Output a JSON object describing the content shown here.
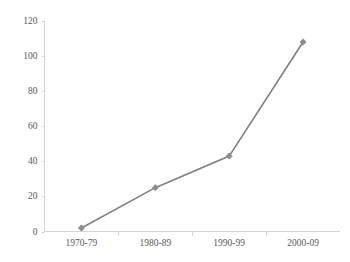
{
  "chart_data": {
    "type": "line",
    "title": "",
    "subtitle": "",
    "xlabel": "",
    "ylabel": "",
    "categories": [
      "1970-79",
      "1980-89",
      "1990-99",
      "2000-09"
    ],
    "values": [
      2,
      25,
      43,
      108
    ],
    "series": [
      {
        "name": "Series 1",
        "values": [
          2,
          25,
          43,
          108
        ]
      }
    ],
    "ylim": [
      0,
      120
    ],
    "yticks": [
      0,
      20,
      40,
      60,
      80,
      100,
      120
    ],
    "ytick_labels": [
      "0",
      "20",
      "40",
      "60",
      "80",
      "100",
      "120"
    ],
    "grid": false,
    "legend": false,
    "legend_position": "none",
    "marker": "diamond",
    "colors": {
      "line": "#808080",
      "marker": "#8c8c8c",
      "axis": "#d4d4d4",
      "tick_text": "#595959",
      "background": "#ffffff"
    }
  }
}
